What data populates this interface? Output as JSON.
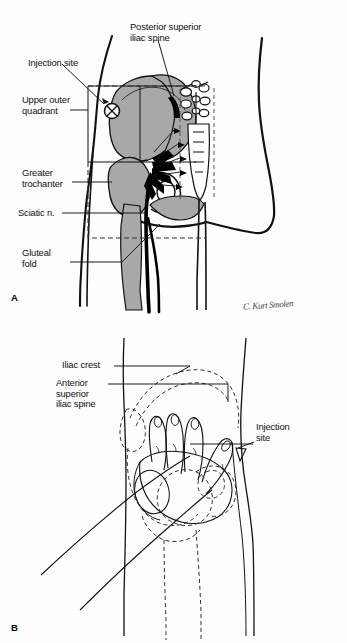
{
  "figure": {
    "background_color": "#fdfdfd",
    "ink_color": "#000000",
    "bone_fill_color": "#a8a8a8",
    "nerve_color": "#000000",
    "width": 347,
    "height": 643
  },
  "panel_a": {
    "letter": "A",
    "signature": "C. Kurt Smolen",
    "labels": {
      "injection_site": "Injection site",
      "upper_outer_quadrant": "Upper outer\nquadrant",
      "posterior_superior_iliac_spine": "Posterior superior\niliac spine",
      "greater_trochanter": "Greater\ntrochanter",
      "sciatic_nerve": "Sciatic n.",
      "gluteal_fold": "Gluteal\nfold"
    },
    "marker": {
      "injection_site_glyph": "circle-with-x"
    }
  },
  "panel_b": {
    "letter": "B",
    "labels": {
      "iliac_crest": "Iliac crest",
      "anterior_superior_iliac_spine": "Anterior\nsuperior\niliac spine",
      "injection_site": "Injection\nsite"
    }
  }
}
